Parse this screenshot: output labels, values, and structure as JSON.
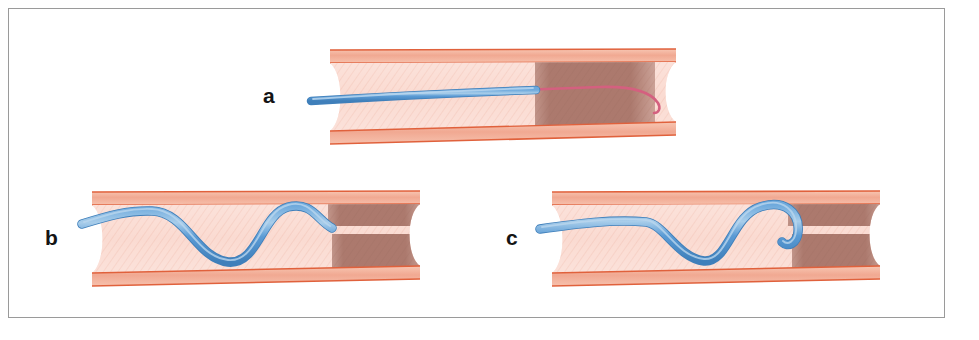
{
  "figure": {
    "frame": {
      "border_color": "#9a9a9a",
      "background_color": "#ffffff"
    },
    "palette": {
      "vessel_wall": "#f0a48c",
      "vessel_wall_line": "#e0613c",
      "vessel_lumen": "#fbded6",
      "vessel_lumen_texture": "#f3c3b6",
      "occlusion": "#a9766a",
      "catheter_blue": "#5b9bd5",
      "catheter_blue_dark": "#3d7cb8",
      "catheter_highlight": "#a9cdea",
      "guidewire_pink": "#d4607f",
      "label_color": "#141414"
    },
    "panels": [
      {
        "id": "panel-a",
        "label": "a",
        "caption": "Guidewire advanced from the catheter tip across the occlusion",
        "devices": [
          "blue-catheter",
          "pink-guidewire"
        ],
        "occlusion_style": "solid-block",
        "catheter_path": "straight",
        "catheter_tip_x": 535
      },
      {
        "id": "panel-b",
        "label": "b",
        "caption": "Catheter looped in a sinusoidal course with tip at the split occlusion channel",
        "devices": [
          "blue-catheter"
        ],
        "occlusion_style": "split-channel",
        "catheter_path": "sine-wave",
        "catheter_tip_x": 330
      },
      {
        "id": "panel-c",
        "label": "c",
        "caption": "Catheter tip curled into a hook at the entry of the split occlusion",
        "devices": [
          "blue-catheter"
        ],
        "occlusion_style": "split-channel",
        "catheter_path": "sine-wave-with-hook",
        "catheter_tip_x": 790
      }
    ]
  }
}
